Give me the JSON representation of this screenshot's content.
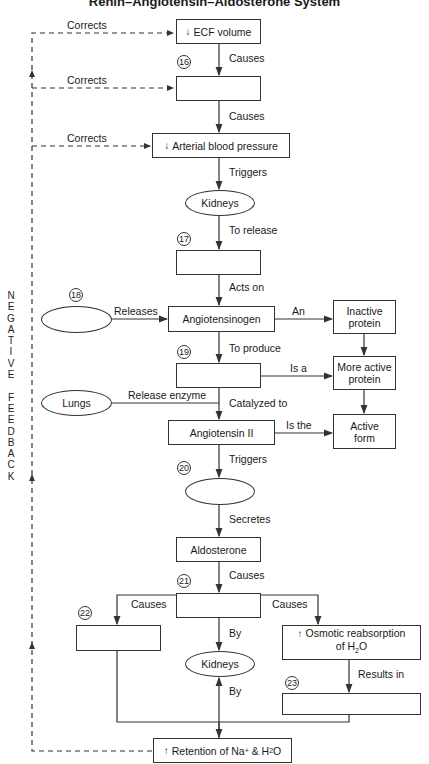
{
  "title": "Renin–Angiotensin–Aldosterone System",
  "side_label": [
    "N",
    "E",
    "G",
    "A",
    "T",
    "I",
    "V",
    "E",
    " ",
    "F",
    "E",
    "E",
    "D",
    "B",
    "A",
    "C",
    "K"
  ],
  "nodes": {
    "ecf": {
      "arrow": "↓",
      "text": "ECF volume"
    },
    "blank16": {
      "text": ""
    },
    "abp": {
      "arrow": "↓",
      "text": "Arterial blood pressure"
    },
    "kidneys1": {
      "text": "Kidneys"
    },
    "blank17": {
      "text": ""
    },
    "blank18": {
      "text": ""
    },
    "angiotensinogen": {
      "text": "Angiotensinogen"
    },
    "inactive": {
      "text": "Inactive protein"
    },
    "blank19": {
      "text": ""
    },
    "more_active": {
      "text": "More active protein"
    },
    "lungs": {
      "text": "Lungs"
    },
    "angiotensin2": {
      "text": "Angiotensin II"
    },
    "active_form": {
      "text": "Active form"
    },
    "blank20": {
      "text": ""
    },
    "aldosterone": {
      "text": "Aldosterone"
    },
    "blank21": {
      "text": ""
    },
    "blank22": {
      "text": ""
    },
    "kidneys2": {
      "text": "Kidneys"
    },
    "osmotic": {
      "arrow": "↑",
      "text": "Osmotic reabsorption",
      "text2": "of H",
      "sub": "2",
      "text3": "O"
    },
    "blank23": {
      "text": ""
    },
    "retention": {
      "arrow": "↑",
      "text": "Retention of Na",
      "sup": "+",
      "text2": " & H",
      "sub": "2",
      "text3": "O"
    }
  },
  "numbers": {
    "n16": "16",
    "n17": "17",
    "n18": "18",
    "n19": "19",
    "n20": "20",
    "n21": "21",
    "n22": "22",
    "n23": "23"
  },
  "edges": {
    "corrects1": "Corrects",
    "corrects2": "Corrects",
    "corrects3": "Corrects",
    "causes1": "Causes",
    "causes2": "Causes",
    "triggers1": "Triggers",
    "to_release": "To release",
    "acts_on": "Acts on",
    "releases": "Releases",
    "an": "An",
    "to_produce": "To produce",
    "is_a": "Is a",
    "release_enzyme": "Release enzyme",
    "catalyzed_to": "Catalyzed to",
    "is_the": "Is the",
    "triggers2": "Triggers",
    "secretes": "Secretes",
    "causes3": "Causes",
    "causes_left": "Causes",
    "causes_right": "Causes",
    "by1": "By",
    "by2": "By",
    "results_in": "Results in"
  }
}
